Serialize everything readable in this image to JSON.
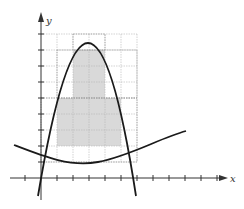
{
  "figure": {
    "type": "area-approximation-between-curves",
    "axes": {
      "x_label": "x",
      "y_label": "y",
      "origin_px": [
        41,
        178
      ],
      "tick_spacing_px": 16,
      "x_ticks_px": [
        25,
        57,
        73,
        89,
        105,
        121,
        137,
        153,
        169,
        185,
        201,
        217
      ],
      "y_ticks_px": [
        162,
        146,
        130,
        114,
        98,
        82,
        66,
        50,
        34
      ]
    },
    "grid": {
      "x_lines_px": [
        57,
        73,
        89,
        105,
        121,
        137
      ],
      "y_lines_px": [
        34,
        50,
        66,
        82,
        98,
        114,
        130,
        146,
        162
      ],
      "color": "#b5b5b5"
    },
    "shaded_regions": [
      {
        "x": 57,
        "y": 98,
        "w": 16,
        "h": 48
      },
      {
        "x": 73,
        "y": 50,
        "w": 32,
        "h": 96
      },
      {
        "x": 105,
        "y": 98,
        "w": 16,
        "h": 48
      }
    ],
    "dotted_outlines": [
      {
        "x": 73,
        "y": 34,
        "w": 32,
        "h": 16
      },
      {
        "x": 57,
        "y": 50,
        "w": 80,
        "h": 48
      },
      {
        "x": 41,
        "y": 98,
        "w": 96,
        "h": 64
      }
    ],
    "curves": [
      {
        "name": "upper-parabola",
        "path": "M 38 196 Q 89 -110 136 196",
        "color": "#1a1a1a"
      },
      {
        "name": "lower-curve",
        "path": "M 14 145 C 45 157, 70 167, 98 162 C 130 156, 160 138, 186 131",
        "color": "#1a1a1a"
      }
    ],
    "colors": {
      "shade": "#d9d9d9",
      "axis": "#333333",
      "curve": "#1a1a1a"
    }
  }
}
